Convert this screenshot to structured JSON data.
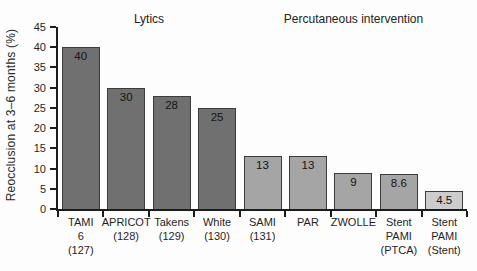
{
  "chart_data": {
    "type": "bar",
    "ylabel": "Reocclusion at 3–6 months (%)",
    "ylim": [
      0,
      45
    ],
    "yticks": [
      0,
      5,
      10,
      15,
      20,
      25,
      30,
      35,
      40,
      45
    ],
    "grid": false,
    "group_titles": [
      {
        "label": "Lytics",
        "start": 0,
        "end": 3
      },
      {
        "label": "Percutaneous intervention",
        "start": 4,
        "end": 8
      }
    ],
    "categories": [
      "TAMI 6 (127)",
      "APRICOT (128)",
      "Takens (129)",
      "White (130)",
      "SAMI (131)",
      "PAR",
      "ZWOLLE",
      "Stent PAMI (PTCA)",
      "Stent PAMI (Stent)"
    ],
    "category_lines": [
      [
        "TAMI",
        "6",
        "(127)"
      ],
      [
        "APRICOT",
        "(128)"
      ],
      [
        "Takens",
        "(129)"
      ],
      [
        "White",
        "(130)"
      ],
      [
        "SAMI",
        "(131)"
      ],
      [
        "PAR"
      ],
      [
        "ZWOLLE"
      ],
      [
        "Stent",
        "PAMI",
        "(PTCA)"
      ],
      [
        "Stent",
        "PAMI",
        "(Stent)"
      ]
    ],
    "values": [
      40,
      30,
      28,
      25,
      13,
      13,
      9,
      8.6,
      4.5
    ],
    "value_labels": [
      "40",
      "30",
      "28",
      "25",
      "13",
      "13",
      "9",
      "8.6",
      "4.5"
    ],
    "bar_colors": [
      "#707070",
      "#707070",
      "#707070",
      "#707070",
      "#a5a5a5",
      "#a5a5a5",
      "#a5a5a5",
      "#a5a5a5",
      "#cccccc"
    ],
    "colors": {
      "lytics_bar": "#707070",
      "percutaneous_bar": "#a5a5a5",
      "stent_bar": "#cccccc",
      "bar_border": "#3c3c3c",
      "axis": "#1c1c1c"
    }
  }
}
